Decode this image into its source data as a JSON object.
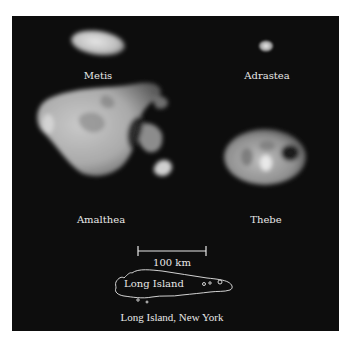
{
  "figure": {
    "background_color": "#0d0d0d",
    "text_color": "#e8e8e8",
    "moons": [
      {
        "name": "Metis"
      },
      {
        "name": "Adrastea"
      },
      {
        "name": "Amalthea"
      },
      {
        "name": "Thebe"
      }
    ],
    "scale_bar": {
      "label": "100 km"
    },
    "comparison": {
      "outline_label": "Long Island",
      "caption": "Long Island, New York"
    }
  }
}
